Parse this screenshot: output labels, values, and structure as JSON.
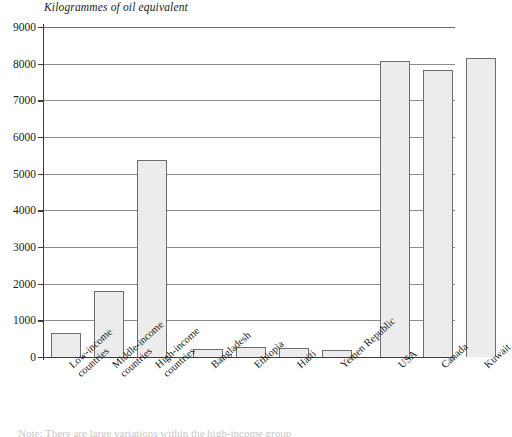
{
  "chart_data": {
    "type": "bar",
    "title": "Kilogrammes of oil equivalent",
    "xlabel": "",
    "ylabel": "",
    "ylim": [
      0,
      9000
    ],
    "ytick_step": 1000,
    "grid": true,
    "legend": "none",
    "categories": [
      "Low-income countries",
      "Middle-income countries",
      "High-income countries",
      "Bangladesh",
      "Ethiopia",
      "Haiti",
      "Yemen Republic",
      "USA",
      "Canada",
      "Kuwait"
    ],
    "category_lines": [
      [
        "Low-income",
        "countries"
      ],
      [
        "Middle-income",
        "countries"
      ],
      [
        "High-income",
        "countries"
      ],
      [
        "Bangladesh"
      ],
      [
        "Ethiopia"
      ],
      [
        "Haiti"
      ],
      [
        "Yemen Republic"
      ],
      [
        "USA"
      ],
      [
        "Canada"
      ],
      [
        "Kuwait"
      ]
    ],
    "values": [
      650,
      1790,
      5380,
      210,
      260,
      250,
      200,
      8060,
      7830,
      8160
    ],
    "ytick_labels": [
      "9000",
      "8000",
      "7000",
      "6000",
      "5000",
      "4000",
      "3000",
      "2000",
      "1000",
      "0"
    ],
    "ytick_values": [
      9000,
      8000,
      7000,
      6000,
      5000,
      4000,
      3000,
      2000,
      1000,
      0
    ],
    "bar_fill": "#ececec",
    "bar_stroke": "#6e6e6e",
    "axis_color": "#3d3d3d",
    "grid_color": "#8d8d8d"
  },
  "caption": {
    "cut_text": "Note: There are large variations within the high-income group"
  }
}
